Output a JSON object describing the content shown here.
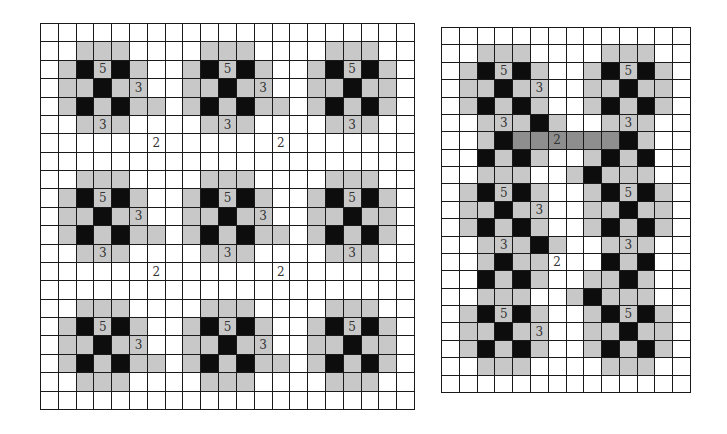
{
  "colors": {
    "white": "#ffffff",
    "gray": "#c8c8c8",
    "black": "#0d0d0d",
    "dark_gray": "#8e8e8e",
    "grid_line": "#1a1a1a"
  },
  "legend_codes": {
    "W": "white",
    "G": "light gray",
    "B": "black",
    "D": "dark gray"
  },
  "left_grid": {
    "cols": 21,
    "rows": 21,
    "rows_data": [
      "WWWWWWWWWWWWWWWWWWWWW",
      "WWGGGWWWWGGGWWWWGGGWW",
      "WGBGBGWWGBGBGWWGBGBGW",
      "WGGBGGWWGGBGGWWGGBGGW",
      "WGBGBGGWGBGBGGWGBGBGW",
      "WWGGGWWWWGGGWWWWGGGWW",
      "WWWWWWWWWWWWWWWWWWWWW",
      "WWWWWWWWWWWWWWWWWWWWW",
      "WWGGGWWWWGGGWWWWGGGWW",
      "WGBGBGWWGBGBGWWGBGBGW",
      "WGGBGGWWGGBGGWWGGBGGW",
      "WGBGBGGWGBGBGGWGBGBGW",
      "WWGGGWWWWGGGWWWWGGGWW",
      "WWWWWWWWWWWWWWWWWWWWW",
      "WWWWWWWWWWWWWWWWWWWWW",
      "WWGGGWWWWGGGWWWWGGGWW",
      "WGBGBGWWGBGBGWWGBGBGW",
      "WGGBGGWWGGBGGWWGGBGGW",
      "WGBGBGGWGBGBGGWGBGBGW",
      "WWGGGWWWWGGGWWWWGGGWW",
      "WWWWWWWWWWWWWWWWWWWWW"
    ],
    "labels": [
      {
        "r": 2,
        "c": 3,
        "t": "5"
      },
      {
        "r": 2,
        "c": 10,
        "t": "5"
      },
      {
        "r": 2,
        "c": 17,
        "t": "5"
      },
      {
        "r": 3,
        "c": 5,
        "t": "3"
      },
      {
        "r": 3,
        "c": 12,
        "t": "3"
      },
      {
        "r": 5,
        "c": 3,
        "t": "3"
      },
      {
        "r": 5,
        "c": 10,
        "t": "3"
      },
      {
        "r": 5,
        "c": 17,
        "t": "3"
      },
      {
        "r": 6,
        "c": 6,
        "t": "2"
      },
      {
        "r": 6,
        "c": 13,
        "t": "2"
      },
      {
        "r": 9,
        "c": 3,
        "t": "5"
      },
      {
        "r": 9,
        "c": 10,
        "t": "5"
      },
      {
        "r": 9,
        "c": 17,
        "t": "5"
      },
      {
        "r": 10,
        "c": 5,
        "t": "3"
      },
      {
        "r": 10,
        "c": 12,
        "t": "3"
      },
      {
        "r": 12,
        "c": 3,
        "t": "3"
      },
      {
        "r": 12,
        "c": 10,
        "t": "3"
      },
      {
        "r": 12,
        "c": 17,
        "t": "3"
      },
      {
        "r": 13,
        "c": 6,
        "t": "2"
      },
      {
        "r": 13,
        "c": 13,
        "t": "2"
      },
      {
        "r": 16,
        "c": 3,
        "t": "5"
      },
      {
        "r": 16,
        "c": 10,
        "t": "5"
      },
      {
        "r": 16,
        "c": 17,
        "t": "5"
      },
      {
        "r": 17,
        "c": 5,
        "t": "3"
      },
      {
        "r": 17,
        "c": 12,
        "t": "3"
      }
    ]
  },
  "right_grid": {
    "cols": 14,
    "rows": 21,
    "rows_data": [
      "WWWWWWWWWWWWWW",
      "WWGGGWWWWGGGWW",
      "WGBGBGWWGBGBGW",
      "WGGBGGWWGGBGGW",
      "WGBGBGWWGBGBGW",
      "WWGGGBGWWGGGWW",
      "WWGBDDDDDDBGWW",
      "WWBGBGWWGBGBWW",
      "WWGGGWWGBGGGWW",
      "WGBGBGWWGBGBGW",
      "WGGBGGWWGGBGGW",
      "WGBGBGWWGBGBGW",
      "WWGGGBGWWGGGWW",
      "WWGBGGWWWBGBWW",
      "WWBGBGWWGGBGWW",
      "WWGGGWWGBGGGWW",
      "WGBGBGWWGBGBGW",
      "WGGBGGWWGGBGGW",
      "WGBGBGWWGBGBGW",
      "WWGGGWWWWGGGWW",
      "WWWWWWWWWWWWWW"
    ],
    "labels": [
      {
        "r": 2,
        "c": 3,
        "t": "5"
      },
      {
        "r": 2,
        "c": 10,
        "t": "5"
      },
      {
        "r": 3,
        "c": 5,
        "t": "3"
      },
      {
        "r": 5,
        "c": 3,
        "t": "3"
      },
      {
        "r": 5,
        "c": 10,
        "t": "3"
      },
      {
        "r": 6,
        "c": 6,
        "t": "2"
      },
      {
        "r": 9,
        "c": 3,
        "t": "5"
      },
      {
        "r": 9,
        "c": 10,
        "t": "5"
      },
      {
        "r": 10,
        "c": 5,
        "t": "3"
      },
      {
        "r": 12,
        "c": 3,
        "t": "3"
      },
      {
        "r": 12,
        "c": 10,
        "t": "3"
      },
      {
        "r": 13,
        "c": 6,
        "t": "2"
      },
      {
        "r": 16,
        "c": 3,
        "t": "5"
      },
      {
        "r": 16,
        "c": 10,
        "t": "5"
      },
      {
        "r": 17,
        "c": 5,
        "t": "3"
      }
    ]
  }
}
